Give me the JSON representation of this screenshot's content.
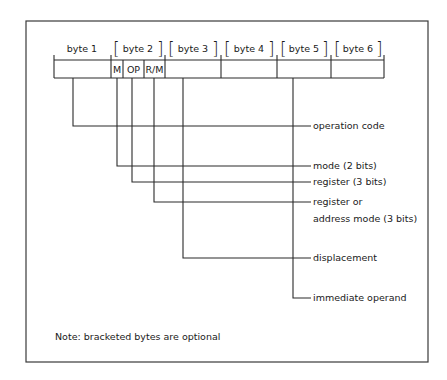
{
  "diagram": {
    "bytes": [
      {
        "label": "byte 1",
        "optional": false
      },
      {
        "label": "byte 2",
        "optional": true
      },
      {
        "label": "byte 3",
        "optional": true
      },
      {
        "label": "byte 4",
        "optional": true
      },
      {
        "label": "byte 5",
        "optional": true
      },
      {
        "label": "byte 6",
        "optional": true
      }
    ],
    "byte2_fields": [
      {
        "label": "M"
      },
      {
        "label": "OP"
      },
      {
        "label": "R/M"
      }
    ],
    "callouts": [
      {
        "label": "operation code"
      },
      {
        "label": "mode (2 bits)"
      },
      {
        "label": "register (3 bits)"
      },
      {
        "label": "register or",
        "label_line2": "address mode (3 bits)"
      },
      {
        "label": "displacement"
      },
      {
        "label": "immediate operand"
      }
    ],
    "note": "Note: bracketed bytes are optional",
    "colors": {
      "line": "#2a2a2a",
      "text": "#1a1a1a",
      "background": "#ffffff"
    }
  }
}
